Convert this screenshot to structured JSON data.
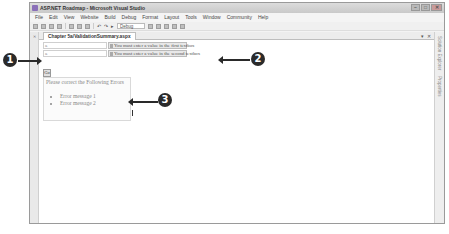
{
  "window": {
    "title": "ASP.NET Roadmap - Microsoft Visual Studio",
    "controls": [
      "minimize",
      "maximize",
      "close"
    ]
  },
  "menubar": {
    "items": [
      "File",
      "Edit",
      "View",
      "Website",
      "Build",
      "Debug",
      "Format",
      "Layout",
      "Tools",
      "Window",
      "Community",
      "Help"
    ]
  },
  "toolbar": {
    "config_value": "Debug"
  },
  "document": {
    "tab_label": "Chapter 5a/ValidationSummary.aspx",
    "tab_controls": [
      "▾",
      "✕"
    ]
  },
  "side_panels": {
    "left_label": "Toolbox",
    "right_label_1": "Solution Explorer",
    "right_label_2": "Properties"
  },
  "form": {
    "textbox1_marker": "a",
    "textbox2_marker": "a",
    "validator1": "You must enter a value in the first textbox",
    "validator2": "You must enter a value in the second textbox",
    "go_button": "Go",
    "summary_header": "Please correct the Following Errors",
    "summary_items": [
      "Error message 1",
      "Error message 2"
    ]
  },
  "callouts": {
    "c1": "1",
    "c2": "2",
    "c3": "3"
  },
  "colors": {
    "callout": "#2a2a2a",
    "validator_bg": "#e8e8e8",
    "summary_text": "#888888"
  }
}
